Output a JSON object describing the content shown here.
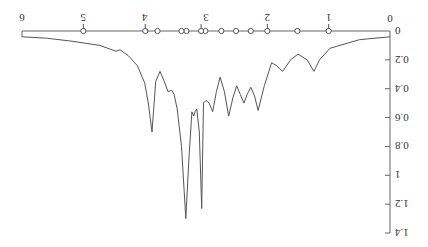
{
  "chart_data": {
    "type": "line",
    "orientation_note": "figure rendered rotated 180 degrees",
    "title": "",
    "xlabel": "",
    "ylabel": "",
    "xlim": [
      0,
      6
    ],
    "ylim": [
      0,
      1.4
    ],
    "x_ticks": [
      "0",
      "1",
      "2",
      "3",
      "4",
      "5",
      "6"
    ],
    "y_ticks": [
      "0",
      "0.2",
      "0.4",
      "0.6",
      "0.8",
      "1",
      "1.2",
      "1.4"
    ],
    "grid": false,
    "line_color": "#555555",
    "series": [
      {
        "name": "spectrum",
        "x": [
          0.0,
          0.5,
          0.98,
          1.15,
          1.24,
          1.35,
          1.5,
          1.62,
          1.75,
          1.85,
          1.93,
          2.05,
          2.15,
          2.21,
          2.27,
          2.33,
          2.38,
          2.44,
          2.5,
          2.56,
          2.63,
          2.7,
          2.77,
          2.83,
          2.89,
          2.95,
          3.0,
          3.04,
          3.07,
          3.11,
          3.15,
          3.18,
          3.2,
          3.23,
          3.28,
          3.33,
          3.4,
          3.47,
          3.52,
          3.56,
          3.62,
          3.68,
          3.75,
          3.82,
          3.88,
          3.94,
          4.0,
          4.12,
          4.27,
          4.34,
          4.4,
          4.47,
          4.73,
          5.2,
          5.6,
          6.0
        ],
        "y": [
          0.04,
          0.06,
          0.12,
          0.2,
          0.28,
          0.2,
          0.16,
          0.2,
          0.28,
          0.24,
          0.22,
          0.38,
          0.55,
          0.45,
          0.39,
          0.44,
          0.5,
          0.44,
          0.38,
          0.46,
          0.59,
          0.42,
          0.32,
          0.42,
          0.56,
          0.5,
          0.48,
          0.5,
          1.23,
          0.7,
          0.54,
          0.56,
          0.59,
          0.56,
          0.9,
          1.3,
          0.8,
          0.54,
          0.44,
          0.41,
          0.42,
          0.35,
          0.28,
          0.35,
          0.7,
          0.5,
          0.36,
          0.24,
          0.17,
          0.15,
          0.13,
          0.14,
          0.1,
          0.07,
          0.05,
          0.04
        ]
      }
    ],
    "markers": {
      "style": "open-circle",
      "x": [
        1.0,
        1.51,
        2.0,
        2.27,
        2.51,
        2.75,
        3.01,
        3.08,
        3.32,
        3.4,
        3.79,
        3.99,
        5.0
      ],
      "y": 0,
      "stems_at_x": [
        1.0,
        2.0,
        3.08,
        3.99,
        5.0
      ]
    }
  }
}
